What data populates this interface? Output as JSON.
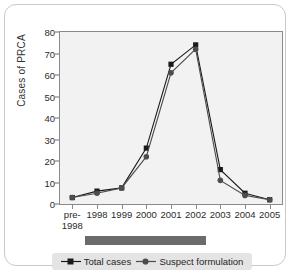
{
  "chart_data": {
    "type": "line",
    "title": "",
    "xlabel": "",
    "ylabel": "Cases of PRCA",
    "categories": [
      "pre-\n1998",
      "1998",
      "1999",
      "2000",
      "2001",
      "2002",
      "2003",
      "2004",
      "2005"
    ],
    "category_labels": [
      {
        "line1": "pre-",
        "line2": "1998"
      },
      {
        "line1": "1998",
        "line2": ""
      },
      {
        "line1": "1999",
        "line2": ""
      },
      {
        "line1": "2000",
        "line2": ""
      },
      {
        "line1": "2001",
        "line2": ""
      },
      {
        "line1": "2002",
        "line2": ""
      },
      {
        "line1": "2003",
        "line2": ""
      },
      {
        "line1": "2004",
        "line2": ""
      },
      {
        "line1": "2005",
        "line2": ""
      }
    ],
    "series": [
      {
        "name": "Total cases",
        "marker": "square",
        "color": "#1a1a1a",
        "values": [
          3,
          6,
          7.5,
          26,
          65,
          74,
          16,
          5,
          2
        ]
      },
      {
        "name": "Suspect formulation",
        "marker": "circle",
        "color": "#4d4d4d",
        "values": [
          3,
          5,
          7.5,
          22,
          61,
          72,
          11,
          4,
          2
        ]
      }
    ],
    "ylim": [
      0,
      80
    ],
    "yticks": [
      0,
      10,
      20,
      30,
      40,
      50,
      60,
      70,
      80
    ],
    "ytick_labels": [
      "0",
      "10",
      "20",
      "30",
      "40",
      "50",
      "60",
      "70",
      "80"
    ],
    "grid": false,
    "legend_position": "bottom",
    "annotations": [
      {
        "name": "period-bar",
        "type": "horizontal-band",
        "from_category": "1998",
        "to_category": "2002",
        "color": "#6b6b6b",
        "label": ""
      }
    ]
  },
  "legend": {
    "items": [
      {
        "label": "Total cases",
        "marker": "square",
        "color": "#1a1a1a"
      },
      {
        "label": "Suspect formulation",
        "marker": "circle",
        "color": "#4d4d4d"
      }
    ]
  },
  "artifact": {
    "text": ""
  }
}
